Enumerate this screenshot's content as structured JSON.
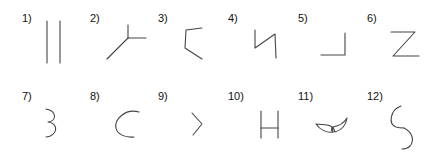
{
  "figures": [
    {
      "label": "1)",
      "shape": "two-parallel-vertical-lines"
    },
    {
      "label": "2)",
      "shape": "y-junction"
    },
    {
      "label": "3)",
      "shape": "open-bracket-angle"
    },
    {
      "label": "4)",
      "shape": "zigzag-n"
    },
    {
      "label": "5)",
      "shape": "right-angle-corner"
    },
    {
      "label": "6)",
      "shape": "letter-z"
    },
    {
      "label": "7)",
      "shape": "number-3-curves"
    },
    {
      "label": "8)",
      "shape": "open-arc-c"
    },
    {
      "label": "9)",
      "shape": "chevron-right"
    },
    {
      "label": "10)",
      "shape": "letter-h"
    },
    {
      "label": "11)",
      "shape": "horn-crescent-pair"
    },
    {
      "label": "12)",
      "shape": "s-curve-arcs"
    }
  ]
}
